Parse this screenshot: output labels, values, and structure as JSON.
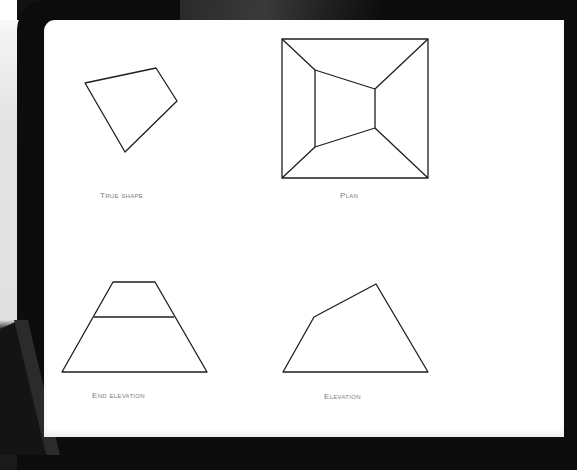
{
  "colors": {
    "bezel": "#0c0c0c",
    "screen": "#ffffff",
    "line": "#1e1e1e",
    "label": "#7a7a7a"
  },
  "views": [
    {
      "id": "true-shape",
      "label": "True Shape",
      "polygons": [
        [
          [
            85,
            83
          ],
          [
            156,
            68
          ],
          [
            177,
            101
          ],
          [
            125,
            152
          ]
        ]
      ],
      "lines": []
    },
    {
      "id": "plan",
      "label": "Plan",
      "polygons": [
        [
          [
            282,
            39
          ],
          [
            428,
            39
          ],
          [
            428,
            178
          ],
          [
            282,
            178
          ]
        ],
        [
          [
            315,
            70
          ],
          [
            375,
            89
          ],
          [
            375,
            128
          ],
          [
            315,
            147
          ]
        ]
      ],
      "lines": [
        [
          [
            282,
            39
          ],
          [
            315,
            70
          ]
        ],
        [
          [
            428,
            39
          ],
          [
            375,
            89
          ]
        ],
        [
          [
            428,
            178
          ],
          [
            375,
            128
          ]
        ],
        [
          [
            282,
            178
          ],
          [
            315,
            147
          ]
        ]
      ]
    },
    {
      "id": "end-elevation",
      "label": "End Elevation",
      "polygons": [
        [
          [
            113,
            282
          ],
          [
            155,
            282
          ],
          [
            207,
            372
          ],
          [
            62,
            372
          ]
        ]
      ],
      "lines": [
        [
          [
            94,
            317
          ],
          [
            174,
            317
          ]
        ]
      ]
    },
    {
      "id": "elevation",
      "label": "Elevation",
      "polygons": [
        [
          [
            283,
            372
          ],
          [
            314,
            317
          ],
          [
            376,
            284
          ],
          [
            428,
            372
          ]
        ]
      ],
      "lines": []
    }
  ]
}
